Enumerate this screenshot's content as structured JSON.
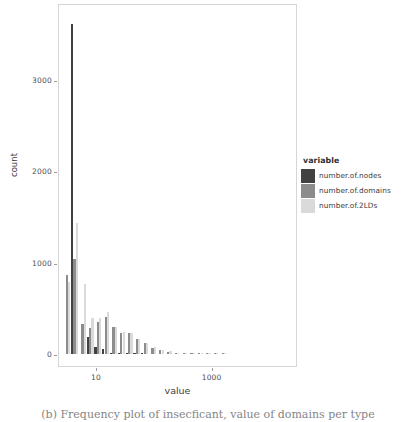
{
  "figure": {
    "caption": "(b) Frequency plot of insecficant, value of domains per type",
    "background": "#ffffff"
  },
  "legend": {
    "title": "variable",
    "position": "right",
    "entries": [
      {
        "label": "number.of.nodes",
        "color": "#414141"
      },
      {
        "label": "number.of.domains",
        "color": "#8c8c8c"
      },
      {
        "label": "number.of.2LDs",
        "color": "#dadada"
      }
    ]
  },
  "chart_data": {
    "type": "bar",
    "title": "",
    "subtitle": "",
    "xlabel": "value",
    "ylabel": "count",
    "grid": false,
    "xscale": "log10",
    "xlim": [
      2.2,
      30000
    ],
    "ylim": [
      0,
      3750
    ],
    "yticks": [
      0,
      1000,
      2000,
      3000
    ],
    "ytick_labels": [
      "0",
      "1000",
      "2000",
      "3000"
    ],
    "xticks": [
      10,
      1000
    ],
    "xtick_labels": [
      "10",
      "1000"
    ],
    "bin_centers": [
      3.0,
      4.1,
      5.6,
      7.6,
      10.4,
      14.2,
      19.3,
      26.4,
      36.0,
      49.1,
      67.0,
      91.4,
      125,
      170,
      232,
      317,
      432,
      590,
      805,
      1100,
      1500
    ],
    "series": [
      {
        "name": "number.of.nodes",
        "color": "#414141",
        "values": [
          0,
          3610,
          0,
          190,
          75,
          55,
          12,
          8,
          4,
          2,
          1,
          0,
          0,
          0,
          0,
          0,
          0,
          0,
          0,
          0,
          0
        ]
      },
      {
        "name": "number.of.domains",
        "color": "#8c8c8c",
        "values": [
          860,
          1040,
          330,
          280,
          350,
          410,
          290,
          230,
          225,
          160,
          120,
          70,
          40,
          25,
          14,
          8,
          5,
          3,
          2,
          1,
          1
        ]
      },
      {
        "name": "number.of.2LDs",
        "color": "#dadada",
        "values": [
          790,
          1430,
          770,
          390,
          390,
          460,
          300,
          240,
          230,
          165,
          125,
          75,
          45,
          28,
          16,
          9,
          6,
          4,
          2,
          1,
          1
        ]
      }
    ],
    "annotations": [
      {
        "text": "tallest bar reaches ~3610 counts at value ~4",
        "series": "number.of.nodes"
      }
    ]
  }
}
